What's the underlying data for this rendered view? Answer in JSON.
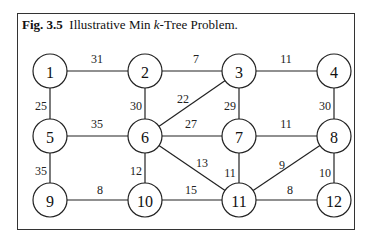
{
  "caption": {
    "fig_label": "Fig. 3.5",
    "text_pre": "Illustrative Min ",
    "text_italic": "k",
    "text_post": "-Tree Problem."
  },
  "graph": {
    "nodes": [
      {
        "id": "1",
        "x": 50,
        "y": 71
      },
      {
        "id": "2",
        "x": 145,
        "y": 71
      },
      {
        "id": "3",
        "x": 239,
        "y": 71
      },
      {
        "id": "4",
        "x": 334,
        "y": 71
      },
      {
        "id": "5",
        "x": 50,
        "y": 136
      },
      {
        "id": "6",
        "x": 145,
        "y": 136
      },
      {
        "id": "7",
        "x": 239,
        "y": 136
      },
      {
        "id": "8",
        "x": 334,
        "y": 136
      },
      {
        "id": "9",
        "x": 50,
        "y": 200
      },
      {
        "id": "10",
        "x": 145,
        "y": 200
      },
      {
        "id": "11",
        "x": 239,
        "y": 200
      },
      {
        "id": "12",
        "x": 334,
        "y": 200
      }
    ],
    "edges": [
      {
        "from": "1",
        "to": "2",
        "weight": "31",
        "lx": 97,
        "ly": 59
      },
      {
        "from": "2",
        "to": "3",
        "weight": "7",
        "lx": 196,
        "ly": 59
      },
      {
        "from": "3",
        "to": "4",
        "weight": "11",
        "lx": 286,
        "ly": 59
      },
      {
        "from": "1",
        "to": "5",
        "weight": "25",
        "lx": 41,
        "ly": 106
      },
      {
        "from": "2",
        "to": "6",
        "weight": "30",
        "lx": 136,
        "ly": 106
      },
      {
        "from": "3",
        "to": "6",
        "weight": "22",
        "lx": 183,
        "ly": 99
      },
      {
        "from": "3",
        "to": "7",
        "weight": "29",
        "lx": 230,
        "ly": 106
      },
      {
        "from": "4",
        "to": "8",
        "weight": "30",
        "lx": 325,
        "ly": 106
      },
      {
        "from": "5",
        "to": "6",
        "weight": "35",
        "lx": 97,
        "ly": 124
      },
      {
        "from": "6",
        "to": "7",
        "weight": "27",
        "lx": 191,
        "ly": 124
      },
      {
        "from": "7",
        "to": "8",
        "weight": "11",
        "lx": 286,
        "ly": 124
      },
      {
        "from": "5",
        "to": "9",
        "weight": "35",
        "lx": 41,
        "ly": 171
      },
      {
        "from": "6",
        "to": "10",
        "weight": "12",
        "lx": 136,
        "ly": 171
      },
      {
        "from": "6",
        "to": "11",
        "weight": "13",
        "lx": 202,
        "ly": 163
      },
      {
        "from": "7",
        "to": "11",
        "weight": "11",
        "lx": 230,
        "ly": 173
      },
      {
        "from": "8",
        "to": "11",
        "weight": "9",
        "lx": 282,
        "ly": 165
      },
      {
        "from": "8",
        "to": "12",
        "weight": "10",
        "lx": 325,
        "ly": 173
      },
      {
        "from": "9",
        "to": "10",
        "weight": "8",
        "lx": 100,
        "ly": 190
      },
      {
        "from": "10",
        "to": "11",
        "weight": "15",
        "lx": 191,
        "ly": 190
      },
      {
        "from": "11",
        "to": "12",
        "weight": "8",
        "lx": 290,
        "ly": 190
      }
    ]
  }
}
